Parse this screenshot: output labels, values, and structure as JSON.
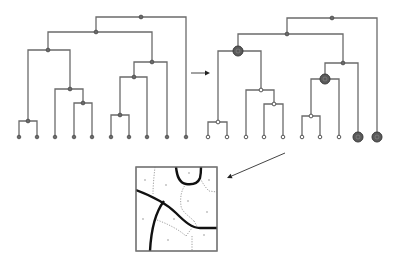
{
  "figure": {
    "colors": {
      "edge": "#6b6b6b",
      "node": "#6a6a6a",
      "highlight_node": "#5a5a5a",
      "thick_boundary": "#111111",
      "thin_boundary": "#888888",
      "background": "#ffffff"
    }
  },
  "left_tree": {
    "leaf_y": 137,
    "leaves": [
      19,
      37,
      55,
      74,
      92,
      111,
      129,
      147,
      167,
      186
    ],
    "internal_nodes": [
      {
        "x": 141,
        "y": 17,
        "left": 96,
        "right": 186,
        "left_child_y": 32,
        "right_child_y": 137
      },
      {
        "x": 96,
        "y": 32,
        "left": 48,
        "right": 152,
        "left_child_y": 50,
        "right_child_y": 62
      },
      {
        "x": 48,
        "y": 50,
        "left": 28,
        "right": 70,
        "left_child_y": 121,
        "right_child_y": 89
      },
      {
        "x": 152,
        "y": 62,
        "left": 134,
        "right": 167,
        "left_child_y": 77,
        "right_child_y": 137
      },
      {
        "x": 134,
        "y": 77,
        "left": 120,
        "right": 147,
        "left_child_y": 115,
        "right_child_y": 137
      },
      {
        "x": 70,
        "y": 89,
        "left": 55,
        "right": 83,
        "left_child_y": 137,
        "right_child_y": 103
      },
      {
        "x": 83,
        "y": 103,
        "left": 74,
        "right": 92,
        "left_child_y": 137,
        "right_child_y": 137
      },
      {
        "x": 120,
        "y": 115,
        "left": 111,
        "right": 129,
        "left_child_y": 137,
        "right_child_y": 137
      },
      {
        "x": 28,
        "y": 121,
        "left": 19,
        "right": 37,
        "left_child_y": 137,
        "right_child_y": 137
      }
    ]
  },
  "right_tree": {
    "leaf_y": 137,
    "leaves": [
      208,
      227,
      246,
      264,
      283,
      302,
      320,
      339,
      358,
      377
    ],
    "highlighted_leaves": [
      358,
      377
    ],
    "internal_nodes": [
      {
        "x": 332,
        "y": 18,
        "left": 287,
        "right": 377,
        "left_child_y": 34,
        "right_child_y": 137,
        "style": "filled"
      },
      {
        "x": 287,
        "y": 34,
        "left": 238,
        "right": 343,
        "left_child_y": 51,
        "right_child_y": 63,
        "style": "filled"
      },
      {
        "x": 238,
        "y": 51,
        "left": 218,
        "right": 261,
        "left_child_y": 122,
        "right_child_y": 90,
        "style": "big"
      },
      {
        "x": 343,
        "y": 63,
        "left": 325,
        "right": 358,
        "left_child_y": 79,
        "right_child_y": 137,
        "style": "filled"
      },
      {
        "x": 325,
        "y": 79,
        "left": 311,
        "right": 339,
        "left_child_y": 116,
        "right_child_y": 137,
        "style": "big"
      },
      {
        "x": 261,
        "y": 90,
        "left": 246,
        "right": 274,
        "left_child_y": 137,
        "right_child_y": 104,
        "style": "open"
      },
      {
        "x": 274,
        "y": 104,
        "left": 264,
        "right": 283,
        "left_child_y": 137,
        "right_child_y": 137,
        "style": "open"
      },
      {
        "x": 311,
        "y": 116,
        "left": 302,
        "right": 320,
        "left_child_y": 137,
        "right_child_y": 137,
        "style": "open"
      },
      {
        "x": 218,
        "y": 122,
        "left": 208,
        "right": 227,
        "left_child_y": 137,
        "right_child_y": 137,
        "style": "open"
      }
    ]
  },
  "arrows": [
    {
      "name": "transform-arrow",
      "x1": 191,
      "y1": 73,
      "x2": 210,
      "y2": 73
    },
    {
      "name": "partition-arrow",
      "x1": 285,
      "y1": 153,
      "x2": 227,
      "y2": 178
    }
  ],
  "partition": {
    "box": {
      "x": 136,
      "y": 167,
      "width": 81,
      "height": 84
    },
    "thick_paths": [
      "M176,167 C177,176 179,183 186,184 C193,185 198,183 200,178 C201,174 201,170 201,167",
      "M136,190 C152,196 165,202 176,213 C185,222 192,228 200,228 L217,228",
      "M164,201 C154,214 151,232 150,251"
    ],
    "dotted_paths": [
      "M155,167 C154,176 153,186 153,194",
      "M186,184 C181,190 180,198 181,206 C182,212 189,216 194,221",
      "M200,178 C203,184 206,188 209,191 L217,192",
      "M194,221 L198,228",
      "M157,220 C168,224 178,229 186,236",
      "M186,236 L192,228",
      "M192,236 L192,251"
    ],
    "seeds": [
      [
        145,
        180
      ],
      [
        166,
        185
      ],
      [
        189,
        173
      ],
      [
        209,
        180
      ],
      [
        188,
        201
      ],
      [
        207,
        212
      ],
      [
        143,
        219
      ],
      [
        174,
        219
      ],
      [
        168,
        240
      ],
      [
        204,
        235
      ]
    ]
  }
}
